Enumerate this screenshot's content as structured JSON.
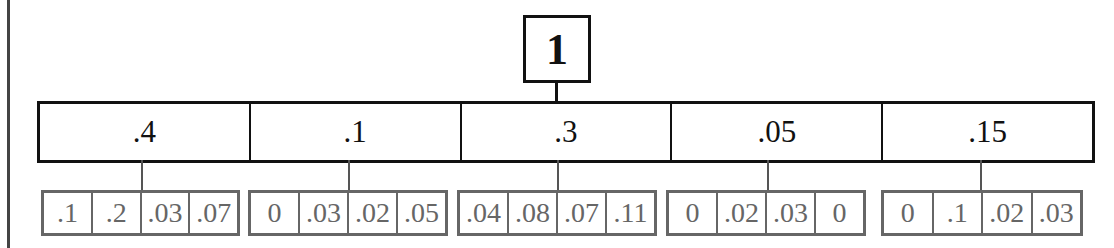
{
  "diagram": {
    "root": {
      "label": "1"
    },
    "level1": [
      {
        "label": ".4",
        "children": [
          ".1",
          ".2",
          ".03",
          ".07"
        ]
      },
      {
        "label": ".1",
        "children": [
          "0",
          ".03",
          ".02",
          ".05"
        ]
      },
      {
        "label": ".3",
        "children": [
          ".04",
          ".08",
          ".07",
          ".11"
        ]
      },
      {
        "label": ".05",
        "children": [
          "0",
          ".02",
          ".03",
          "0"
        ]
      },
      {
        "label": ".15",
        "children": [
          "0",
          ".1",
          ".02",
          ".03"
        ]
      }
    ]
  },
  "colors": {
    "primary_border": "#111111",
    "secondary_border": "#666666",
    "secondary_text": "#666666"
  }
}
